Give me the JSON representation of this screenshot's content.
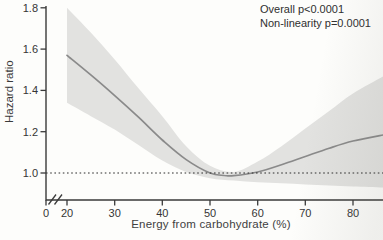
{
  "page": {
    "background": "#fdfdfb"
  },
  "chart_data": {
    "type": "line",
    "title": "",
    "xlabel": "Energy from carbohydrate (%)",
    "ylabel": "Hazard ratio",
    "annotations": {
      "line1": "Overall p<0.0001",
      "line2": "Non-linearity p=0.0001"
    },
    "xlim": [
      20,
      86.5
    ],
    "ylim": [
      0.87,
      1.81
    ],
    "x_axis_break": true,
    "grid": "off",
    "legend_position": "none",
    "x_ticks": [
      {
        "value": 0,
        "label": "0"
      },
      {
        "value": 20,
        "label": "20"
      },
      {
        "value": 30,
        "label": "30"
      },
      {
        "value": 40,
        "label": "40"
      },
      {
        "value": 50,
        "label": "50"
      },
      {
        "value": 60,
        "label": "60"
      },
      {
        "value": 70,
        "label": "70"
      },
      {
        "value": 80,
        "label": "80"
      }
    ],
    "y_ticks": [
      {
        "value": 1.0,
        "label": "1.0"
      },
      {
        "value": 1.2,
        "label": "1.2"
      },
      {
        "value": 1.4,
        "label": "1.4"
      },
      {
        "value": 1.6,
        "label": "1.6"
      },
      {
        "value": 1.8,
        "label": "1.8"
      }
    ],
    "reference_line": {
      "y": 1.0,
      "style": "dotted"
    },
    "series": [
      {
        "name": "hazard_ratio_spline",
        "x": [
          20,
          25,
          30,
          35,
          40,
          45,
          50,
          53,
          55,
          60,
          65,
          70,
          75,
          80,
          86.5
        ],
        "y": [
          1.57,
          1.475,
          1.375,
          1.27,
          1.16,
          1.065,
          1.0,
          0.988,
          0.987,
          1.005,
          1.04,
          1.08,
          1.12,
          1.155,
          1.185
        ]
      }
    ],
    "confidence_band": {
      "x": [
        20,
        25,
        30,
        35,
        40,
        45,
        50,
        55,
        60,
        65,
        70,
        75,
        80,
        86.5
      ],
      "upper": [
        1.8,
        1.68,
        1.55,
        1.41,
        1.275,
        1.13,
        1.035,
        1.005,
        1.055,
        1.13,
        1.215,
        1.3,
        1.385,
        1.47
      ],
      "lower": [
        1.34,
        1.275,
        1.21,
        1.135,
        1.06,
        1.005,
        0.975,
        0.963,
        0.955,
        0.95,
        0.945,
        0.94,
        0.935,
        0.93
      ]
    },
    "colors": {
      "line": "#8a8a8a",
      "band": "#e2e2e0",
      "axis": "#3a3a3a",
      "text": "#333333",
      "reference_line": "#2b2b2b"
    }
  }
}
